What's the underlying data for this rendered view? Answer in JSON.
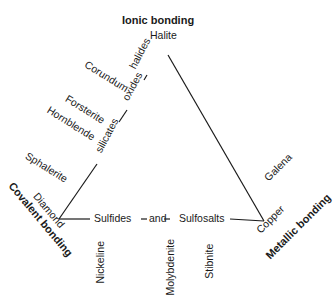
{
  "vertices": {
    "ionic": {
      "label": "Ionic bonding",
      "mineral": "Halite"
    },
    "covalent": {
      "label": "Covalent bonding",
      "mineral": "Diamond"
    },
    "metallic": {
      "label": "Metallic bonding",
      "mineral": "Copper"
    }
  },
  "edges": {
    "left": {
      "upper": "oxides",
      "upper2": "halides",
      "lower": "silicates"
    },
    "bottom": {
      "a": "Sulfides",
      "b": "and",
      "c": "Sulfosalts"
    }
  },
  "minerals": {
    "corundum": "Corundum",
    "forsterite": "Forsterite",
    "hornblende": "Hornblende",
    "sphalerite": "Sphalerite",
    "galena": "Galena",
    "nickeline": "Nickeline",
    "molybdenite": "Molybdenite",
    "stibnite": "Stibnite"
  },
  "colors": {
    "line": "#1a1a1a",
    "text": "#1a1a1a",
    "background": "#ffffff"
  }
}
